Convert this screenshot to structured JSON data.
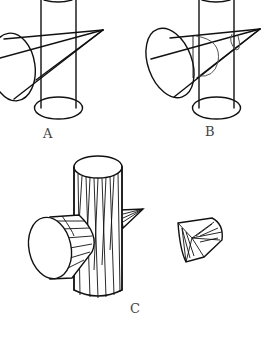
{
  "figure": {
    "panels": [
      {
        "id": "A",
        "label": "A",
        "description": "Cone intersecting a vertical cylinder (wireframe outline)"
      },
      {
        "id": "B",
        "label": "B",
        "description": "Cone intersecting a vertical cylinder with intersection curves shown"
      },
      {
        "id": "C",
        "label": "C",
        "description": "Tessellated solid cylinder with cone passing through, and resulting intersection piece"
      }
    ],
    "colors": {
      "line": "#111111",
      "background": "#ffffff",
      "label": "#444444"
    }
  }
}
